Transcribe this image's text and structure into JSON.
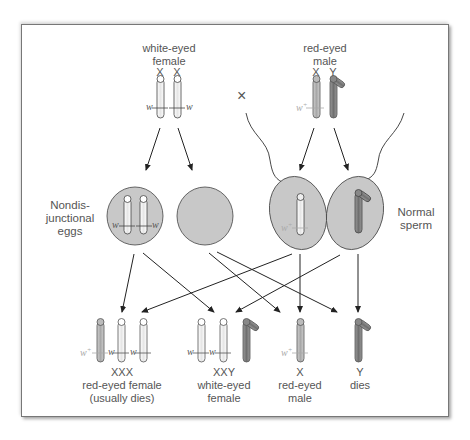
{
  "parents": {
    "female": {
      "label_line1": "white-eyed",
      "label_line2": "female",
      "chrom1": "X",
      "chrom2": "X",
      "allele_left": "w",
      "allele_right": "w"
    },
    "cross_symbol": "×",
    "male": {
      "label_line1": "red-eyed",
      "label_line2": "male",
      "chrom1": "X",
      "chrom2": "Y",
      "allele": "w+"
    }
  },
  "gametes": {
    "eggs_label_line1": "Nondis-",
    "eggs_label_line2": "junctional",
    "eggs_label_line3": "eggs",
    "egg_allele_left": "w",
    "egg_allele_right": "w",
    "sperm_label_line1": "Normal",
    "sperm_label_line2": "sperm",
    "sperm_allele": "w+"
  },
  "offspring": [
    {
      "genotype": "XXX",
      "line1": "red-eyed female",
      "line2": "(usually dies)",
      "alleles": [
        "w+",
        "w",
        "w"
      ]
    },
    {
      "genotype": "XXY",
      "line1": "white-eyed",
      "line2": "female",
      "alleles": [
        "w",
        "w"
      ]
    },
    {
      "genotype": "X",
      "line1": "red-eyed",
      "line2": "male",
      "alleles": [
        "w+"
      ]
    },
    {
      "genotype": "Y",
      "line1": "dies",
      "line2": "",
      "alleles": []
    }
  ],
  "colors": {
    "cell_fill": "#c8c8c8",
    "x_white": "#ffffff",
    "x_red_gray": "#bdbdbd",
    "y_dark": "#8a8a8a",
    "line": "#333333",
    "text": "#555555"
  }
}
